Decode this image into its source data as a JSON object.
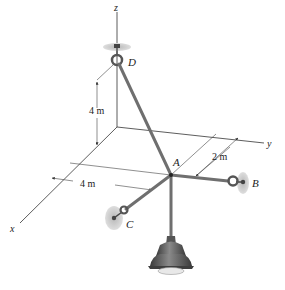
{
  "figure": {
    "type": "3D statics diagram"
  },
  "axes": {
    "x_label": "x",
    "y_label": "y",
    "z_label": "z"
  },
  "points": {
    "A": "A",
    "B": "B",
    "C": "C",
    "D": "D"
  },
  "dimensions": {
    "vertical_height": "4 m",
    "x_distance": "4 m",
    "y_offset": "2 m"
  },
  "colors": {
    "line": "#333333",
    "cable": "#6f6f6f",
    "plate": "#c8c8c8",
    "lamp": "#5e5e5e"
  }
}
